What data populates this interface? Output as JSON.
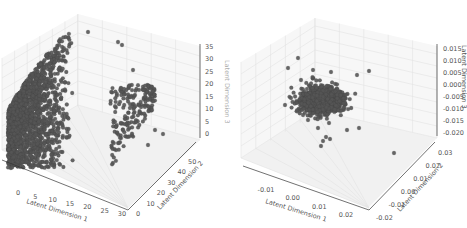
{
  "figure": {
    "colors": {
      "points": "#555555",
      "grid": "#e2e2e2",
      "pane": "#f4f4f4",
      "axis": "#333333",
      "text": "#555555"
    }
  },
  "chart_data": [
    {
      "type": "scatter3d",
      "title": "",
      "xlabel": "Latent Dimension 1",
      "ylabel": "Latent Dimension 2",
      "zlabel": "Latent Dimension 3",
      "xticks": [
        "0",
        "5",
        "10",
        "15",
        "20",
        "25",
        "30"
      ],
      "yticks": [
        "0",
        "10",
        "20",
        "30",
        "40",
        "50"
      ],
      "zticks": [
        "0",
        "5",
        "10",
        "15",
        "20",
        "25",
        "30",
        "35"
      ],
      "xlim": [
        0,
        33
      ],
      "ylim": [
        0,
        55
      ],
      "zlim": [
        -2,
        37
      ],
      "description": "Dense cloud of several thousand points filling a dome/triangular region, concentrated near x 0-25, y 0-40, z 0-30, with sparse outliers toward high x and y",
      "grid": true,
      "marker_color": "#555555"
    },
    {
      "type": "scatter3d",
      "title": "",
      "xlabel": "Latent Dimension 1",
      "ylabel": "Latent Dimension 2",
      "zlabel": "Latent Dimension 3",
      "xticks": [
        "-0.01",
        "0.00",
        "0.01",
        "0.02"
      ],
      "yticks": [
        "-0.02",
        "-0.01",
        "0.00",
        "0.01",
        "0.02",
        "0.03"
      ],
      "zticks": [
        "-0.020",
        "-0.015",
        "-0.010",
        "-0.005",
        "0.000",
        "0.005",
        "0.010",
        "0.015"
      ],
      "xlim": [
        -0.018,
        0.028
      ],
      "ylim": [
        -0.022,
        0.035
      ],
      "zlim": [
        -0.022,
        0.017
      ],
      "description": "Tight compact cluster of points centered near the origin (approx 0,0,-0.005) with a few scattered outliers",
      "grid": true,
      "marker_color": "#555555"
    }
  ]
}
